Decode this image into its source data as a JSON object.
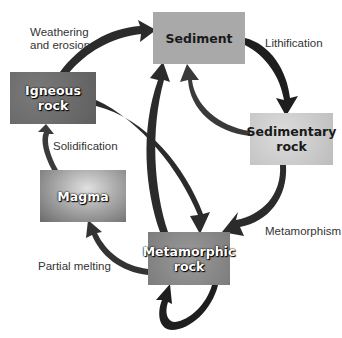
{
  "diagram": {
    "nodes": {
      "sediment": {
        "line1": "Sediment",
        "line2": ""
      },
      "igneous": {
        "line1": "Igneous",
        "line2": "rock"
      },
      "sedimentary": {
        "line1": "Sedimentary",
        "line2": "rock"
      },
      "magma": {
        "line1": "Magma",
        "line2": ""
      },
      "metamorphic": {
        "line1": "Metamorphic",
        "line2": "rock"
      }
    },
    "processes": {
      "weathering_line1": "Weathering",
      "weathering_line2": "and erosion",
      "lithification": "Lithification",
      "solidification": "Solidification",
      "metamorphism": "Metamorphism",
      "partial_melting": "Partial melting"
    },
    "edges": [
      {
        "from": "Igneous rock",
        "to": "Sediment",
        "label": "Weathering and erosion"
      },
      {
        "from": "Sediment",
        "to": "Sedimentary rock",
        "label": "Lithification"
      },
      {
        "from": "Sedimentary rock",
        "to": "Sediment",
        "label": ""
      },
      {
        "from": "Sedimentary rock",
        "to": "Metamorphic rock",
        "label": "Metamorphism"
      },
      {
        "from": "Igneous rock",
        "to": "Metamorphic rock",
        "label": ""
      },
      {
        "from": "Metamorphic rock",
        "to": "Sediment",
        "label": ""
      },
      {
        "from": "Metamorphic rock",
        "to": "Magma",
        "label": "Partial melting"
      },
      {
        "from": "Magma",
        "to": "Igneous rock",
        "label": "Solidification"
      },
      {
        "from": "Metamorphic rock",
        "to": "Metamorphic rock",
        "label": ""
      }
    ],
    "colors": {
      "arrow": "#2b2b2b",
      "sediment_box": "#a9a9a9",
      "igneous_box": "#6e6e6e",
      "sedimentary_box": "#cfcfcf",
      "metamorphic_box": "#8d8d8d"
    }
  }
}
